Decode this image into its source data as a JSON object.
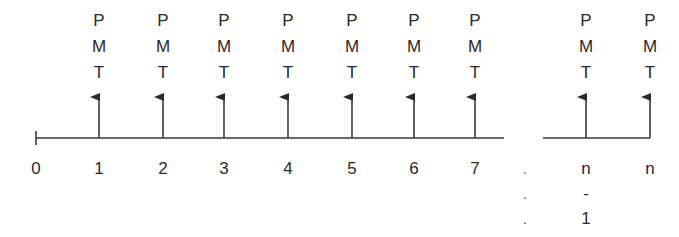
{
  "diagram": {
    "type": "annuity-cash-flow-timeline",
    "colors": {
      "line": "#3a3a3a",
      "text": "#2a2a2a",
      "background": "#ffffff"
    },
    "timeline": {
      "y": 138,
      "segments": [
        {
          "x1": 36,
          "x2": 504
        },
        {
          "x1": 543,
          "x2": 650
        }
      ],
      "start_tick_x": 36
    },
    "payment_label": [
      "P",
      "M",
      "T"
    ],
    "periods": [
      {
        "x": 36,
        "label": "0",
        "payment": false
      },
      {
        "x": 99,
        "label": "1",
        "payment": true
      },
      {
        "x": 163,
        "label": "2",
        "payment": true
      },
      {
        "x": 224,
        "label": "3",
        "payment": true
      },
      {
        "x": 288,
        "label": "4",
        "payment": true
      },
      {
        "x": 352,
        "label": "5",
        "payment": true
      },
      {
        "x": 414,
        "label": "6",
        "payment": true
      },
      {
        "x": 475,
        "label": "7",
        "payment": true
      },
      {
        "x": 586,
        "label": [
          "n",
          "-",
          "1"
        ],
        "payment": true
      },
      {
        "x": 650,
        "label": "n",
        "payment": true
      }
    ],
    "ellipsis": {
      "x": 525,
      "glyphs": [
        ".",
        ".",
        "."
      ]
    }
  }
}
